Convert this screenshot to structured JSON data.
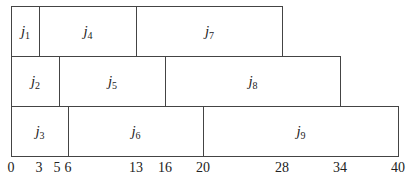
{
  "diagram": {
    "type": "gantt-schedule",
    "rows": [
      {
        "machine": 1,
        "jobs": [
          {
            "name": "j",
            "sub": "1",
            "start": 0,
            "end": 3
          },
          {
            "name": "j",
            "sub": "4",
            "start": 3,
            "end": 13
          },
          {
            "name": "j",
            "sub": "7",
            "start": 13,
            "end": 28
          }
        ]
      },
      {
        "machine": 2,
        "jobs": [
          {
            "name": "j",
            "sub": "2",
            "start": 0,
            "end": 5
          },
          {
            "name": "j",
            "sub": "5",
            "start": 5,
            "end": 16
          },
          {
            "name": "j",
            "sub": "8",
            "start": 16,
            "end": 34
          }
        ]
      },
      {
        "machine": 3,
        "jobs": [
          {
            "name": "j",
            "sub": "3",
            "start": 0,
            "end": 6
          },
          {
            "name": "j",
            "sub": "6",
            "start": 6,
            "end": 20
          },
          {
            "name": "j",
            "sub": "9",
            "start": 20,
            "end": 40
          }
        ]
      }
    ],
    "axis_ticks": [
      "0",
      "3",
      "5",
      "6",
      "13",
      "16",
      "20",
      "28",
      "34",
      "40"
    ]
  }
}
